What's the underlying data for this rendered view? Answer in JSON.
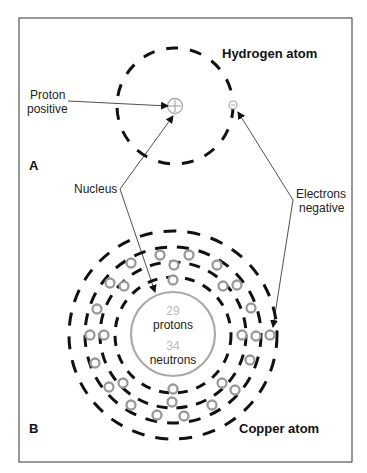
{
  "panel_a": {
    "letter": "A",
    "title": "Hydrogen atom",
    "proton_label_1": "Proton",
    "proton_label_2": "positive"
  },
  "shared": {
    "nucleus_label": "Nucleus",
    "electrons_label_1": "Electrons",
    "electrons_label_2": "negative"
  },
  "panel_b": {
    "letter": "B",
    "title": "Copper atom",
    "protons_count": "29",
    "protons_label": "protons",
    "neutrons_count": "34",
    "neutrons_label": "neutrons"
  },
  "colors": {
    "shell": "#111111",
    "electron": "#999999",
    "nucleus": "#a8a8a8",
    "count_text": "#bbbbbb"
  }
}
